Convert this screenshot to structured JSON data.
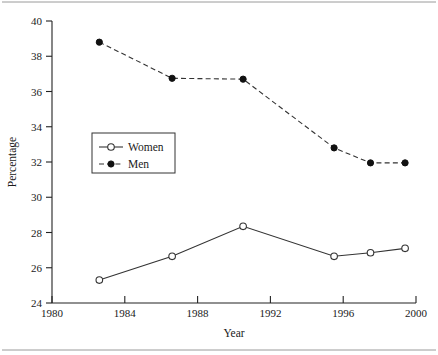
{
  "chart_data": {
    "type": "line",
    "title": "",
    "xlabel": "Year",
    "ylabel": "Percentage",
    "xlim": [
      1980,
      2000
    ],
    "ylim": [
      24,
      40
    ],
    "xticks": [
      1980,
      1984,
      1988,
      1992,
      1996,
      2000
    ],
    "yticks": [
      24,
      26,
      28,
      30,
      32,
      34,
      36,
      38,
      40
    ],
    "grid": false,
    "legend_position": "center-left",
    "series": [
      {
        "name": "Women",
        "marker": "open-circle",
        "linestyle": "solid",
        "color": "#333333",
        "x": [
          1982.6,
          1986.6,
          1990.5,
          1995.5,
          1997.5,
          1999.4
        ],
        "values": [
          25.3,
          26.65,
          28.35,
          26.65,
          26.85,
          27.1
        ]
      },
      {
        "name": "Men",
        "marker": "filled-circle",
        "linestyle": "dashed",
        "color": "#111111",
        "x": [
          1982.6,
          1986.6,
          1990.5,
          1995.5,
          1997.5,
          1999.4
        ],
        "values": [
          38.8,
          36.75,
          36.7,
          32.8,
          31.95,
          31.95
        ]
      }
    ]
  },
  "axis": {
    "y_title": "Percentage",
    "x_title": "Year",
    "x_tick_labels": [
      "1980",
      "1984",
      "1988",
      "1992",
      "1996",
      "2000"
    ],
    "y_tick_labels": [
      "24",
      "26",
      "28",
      "30",
      "32",
      "34",
      "36",
      "38",
      "40"
    ]
  },
  "legend": {
    "entries": [
      {
        "label": "Women",
        "marker": "open-circle",
        "linestyle": "solid"
      },
      {
        "label": "Men",
        "marker": "filled-circle",
        "linestyle": "dashed"
      }
    ]
  }
}
